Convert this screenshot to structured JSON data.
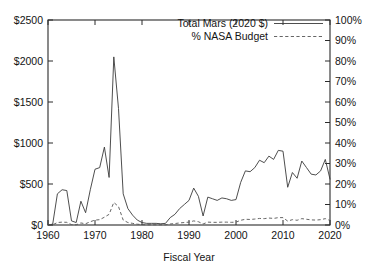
{
  "chart_data": {
    "type": "line",
    "title": "",
    "xlabel": "Fiscal Year",
    "ylabel": "",
    "xlim": [
      1960,
      2020
    ],
    "ylim": [
      0,
      2500
    ],
    "y2lim": [
      0,
      100
    ],
    "grid": false,
    "legend_position": "top-right",
    "x_ticks": [
      "1960",
      "1970",
      "1980",
      "1990",
      "2000",
      "2010",
      "2020"
    ],
    "x_tick_values": [
      1960,
      1970,
      1980,
      1990,
      2000,
      2010,
      2020
    ],
    "y_ticks": [
      "$0",
      "$500",
      "$1000",
      "$1500",
      "$2000",
      "$2500"
    ],
    "y_tick_values": [
      0,
      500,
      1000,
      1500,
      2000,
      2500
    ],
    "y2_ticks": [
      "0%",
      "10%",
      "20%",
      "30%",
      "40%",
      "50%",
      "60%",
      "70%",
      "80%",
      "90%",
      "100%"
    ],
    "y2_tick_values": [
      0,
      10,
      20,
      30,
      40,
      50,
      60,
      70,
      80,
      90,
      100
    ],
    "x": [
      1960,
      1961,
      1962,
      1963,
      1964,
      1965,
      1966,
      1967,
      1968,
      1969,
      1970,
      1971,
      1972,
      1973,
      1974,
      1975,
      1976,
      1977,
      1978,
      1979,
      1980,
      1981,
      1982,
      1983,
      1984,
      1985,
      1986,
      1987,
      1988,
      1989,
      1990,
      1991,
      1992,
      1993,
      1994,
      1995,
      1996,
      1997,
      1998,
      1999,
      2000,
      2001,
      2002,
      2003,
      2004,
      2005,
      2006,
      2007,
      2008,
      2009,
      2010,
      2011,
      2012,
      2013,
      2014,
      2015,
      2016,
      2017,
      2018,
      2019,
      2020
    ],
    "series": [
      {
        "name": "Total Mars (2020 $)",
        "axis": "left",
        "style": "solid",
        "units": "millions of 2020 dollars",
        "values": [
          0,
          10,
          380,
          430,
          420,
          50,
          30,
          290,
          150,
          430,
          680,
          700,
          950,
          580,
          2050,
          1420,
          380,
          200,
          120,
          60,
          30,
          20,
          20,
          20,
          15,
          20,
          90,
          130,
          200,
          250,
          300,
          450,
          350,
          110,
          340,
          320,
          300,
          330,
          320,
          300,
          310,
          520,
          660,
          650,
          700,
          790,
          760,
          840,
          800,
          910,
          900,
          460,
          640,
          570,
          780,
          700,
          620,
          610,
          660,
          800,
          560
        ]
      },
      {
        "name": "% NASA Budget",
        "axis": "right",
        "style": "dashed",
        "units": "percent of NASA budget",
        "values": [
          0,
          0.1,
          1.2,
          1.4,
          1.3,
          0.2,
          0.1,
          1.0,
          0.6,
          1.6,
          2.4,
          2.6,
          3.8,
          5.2,
          11.0,
          9.0,
          2.4,
          1.2,
          0.8,
          0.4,
          0.2,
          0.1,
          0.1,
          0.1,
          0.1,
          0.1,
          0.5,
          0.7,
          1.0,
          1.2,
          1.4,
          2.0,
          1.6,
          0.5,
          1.4,
          1.3,
          1.3,
          1.4,
          1.4,
          1.3,
          1.4,
          2.3,
          2.8,
          2.7,
          2.9,
          3.2,
          3.1,
          3.4,
          3.2,
          3.6,
          3.6,
          1.9,
          2.6,
          2.3,
          3.1,
          2.8,
          2.5,
          2.4,
          2.6,
          3.1,
          2.2
        ]
      }
    ],
    "legend": [
      "Total Mars (2020 $)",
      "% NASA Budget"
    ]
  }
}
